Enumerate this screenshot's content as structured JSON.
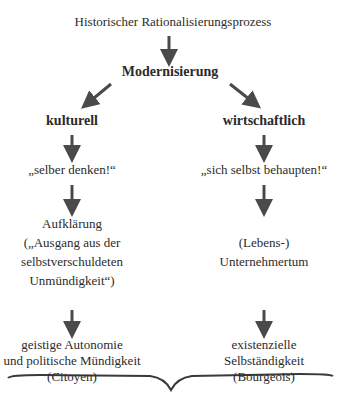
{
  "diagram": {
    "root": "Historischer Rationalisierungsprozess",
    "level1": "Modernisierung",
    "left": {
      "heading": "kulturell",
      "motto": "„selber denken!“",
      "concept": [
        "Aufklärung",
        "(„Ausgang aus der",
        "selbstverschuldeten",
        "Unmündigkeit“)"
      ],
      "result": [
        "geistige Autonomie",
        "und politische Mündigkeit",
        "(Citoyen)"
      ]
    },
    "right": {
      "heading": "wirtschaftlich",
      "motto": "„sich selbst behaupten!“",
      "concept": [
        "(Lebens-)",
        "Unternehmertum"
      ],
      "result": [
        "existenzielle",
        "Selbständigkeit",
        "(Bourgeois)"
      ]
    },
    "colors": {
      "text": "#2b2b2b",
      "arrow": "#4a4a4a"
    }
  }
}
